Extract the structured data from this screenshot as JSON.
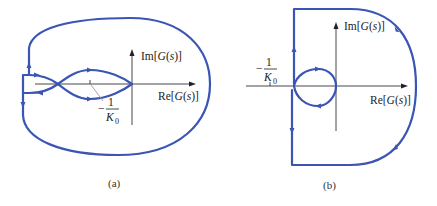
{
  "figure": {
    "colors": {
      "curve": "#3a55b4",
      "axis": "#333333",
      "background": "#ffffff"
    },
    "panels": [
      {
        "id": "a",
        "caption": "(a)",
        "axes": {
          "x_label_pre": "Re[",
          "x_label_var": "G",
          "x_label_paren": "(",
          "x_label_s": "s",
          "x_label_post": ")]",
          "y_label_pre": "Im[",
          "y_label_var": "G",
          "y_label_paren": "(",
          "y_label_s": "s",
          "y_label_post": ")]"
        },
        "critical_point_label": {
          "sign": "−",
          "numerator": "1",
          "denominator_var": "K",
          "denominator_sub": "0"
        }
      },
      {
        "id": "b",
        "caption": "(b)",
        "axes": {
          "x_label_pre": "Re[",
          "x_label_var": "G",
          "x_label_paren": "(",
          "x_label_s": "s",
          "x_label_post": ")]",
          "y_label_pre": "Im[",
          "y_label_var": "G",
          "y_label_paren": "(",
          "y_label_s": "s",
          "y_label_post": ")]"
        },
        "critical_point_label": {
          "sign": "−",
          "numerator": "1",
          "denominator_var": "K",
          "denominator_sub": "0"
        }
      }
    ]
  }
}
